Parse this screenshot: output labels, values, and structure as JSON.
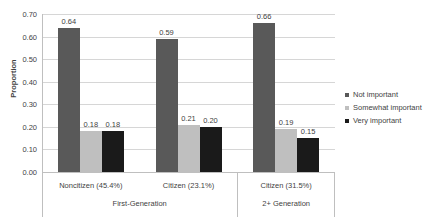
{
  "chart_data": {
    "type": "bar",
    "title": "",
    "xlabel": "",
    "ylabel": "Proportion",
    "ylim": [
      0.0,
      0.7
    ],
    "ytick_labels": [
      "0.00",
      "0.10",
      "0.20",
      "0.30",
      "0.40",
      "0.50",
      "0.60",
      "0.70"
    ],
    "ytick_values": [
      0.0,
      0.1,
      0.2,
      0.3,
      0.4,
      0.5,
      0.6,
      0.7
    ],
    "grid": true,
    "legend_position": "right",
    "categories": [
      "Noncitizen (45.4%)",
      "Citizen (23.1%)",
      "Citizen (31.5%)"
    ],
    "group_labels": [
      "First-Generation",
      "2+ Generation"
    ],
    "group_spans": [
      2,
      1
    ],
    "series": [
      {
        "name": "Not important",
        "color": "#595959",
        "values": [
          0.64,
          0.59,
          0.66
        ],
        "labels": [
          "0.64",
          "0.59",
          "0.66"
        ]
      },
      {
        "name": "Somewhat important",
        "color": "#bfbfbf",
        "values": [
          0.18,
          0.21,
          0.19
        ],
        "labels": [
          "0.18",
          "0.21",
          "0.19"
        ]
      },
      {
        "name": "Very important",
        "color": "#1a1a1a",
        "values": [
          0.18,
          0.2,
          0.15
        ],
        "labels": [
          "0.18",
          "0.20",
          "0.15"
        ]
      }
    ]
  },
  "colors": {
    "background": "#ffffff",
    "gridline": "#d6d6d6",
    "axis": "#bfbfbf",
    "text": "#3f3f3f",
    "not_important": "#595959",
    "somewhat_important": "#bfbfbf",
    "very_important": "#1a1a1a"
  }
}
